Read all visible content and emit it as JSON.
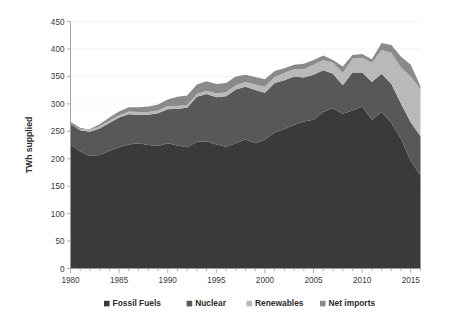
{
  "chart_data": {
    "type": "area",
    "stacked": true,
    "title": "",
    "subtitle": "",
    "xlabel": "",
    "ylabel": "TWh supplied",
    "xlim": [
      1980,
      2016
    ],
    "ylim": [
      0,
      450
    ],
    "ytick_step": 50,
    "yticks": [
      0,
      50,
      100,
      150,
      200,
      250,
      300,
      350,
      400,
      450
    ],
    "xticks": [
      1980,
      1985,
      1990,
      1995,
      2000,
      2005,
      2010,
      2015
    ],
    "grid": "horizontal-faint",
    "legend_position": "bottom",
    "x": [
      1980,
      1981,
      1982,
      1983,
      1984,
      1985,
      1986,
      1987,
      1988,
      1989,
      1990,
      1991,
      1992,
      1993,
      1994,
      1995,
      1996,
      1997,
      1998,
      1999,
      2000,
      2001,
      2002,
      2003,
      2004,
      2005,
      2006,
      2007,
      2008,
      2009,
      2010,
      2011,
      2012,
      2013,
      2014,
      2015,
      2016
    ],
    "series": [
      {
        "name": "Fossil Fuels",
        "color": "#3a3a3a",
        "values": [
          226,
          213,
          205,
          207,
          214,
          221,
          226,
          228,
          225,
          223,
          228,
          224,
          221,
          231,
          232,
          226,
          222,
          228,
          235,
          228,
          235,
          248,
          254,
          262,
          268,
          271,
          285,
          292,
          282,
          288,
          295,
          271,
          285,
          265,
          236,
          196,
          170
        ]
      },
      {
        "name": "Nuclear",
        "color": "#585858",
        "values": [
          37,
          39,
          44,
          48,
          51,
          54,
          55,
          52,
          55,
          60,
          62,
          67,
          72,
          82,
          86,
          86,
          92,
          98,
          96,
          97,
          85,
          90,
          89,
          88,
          80,
          82,
          76,
          63,
          52,
          69,
          62,
          69,
          70,
          71,
          64,
          70,
          71
        ]
      },
      {
        "name": "Renewables",
        "color": "#b9b9b9",
        "values": [
          4,
          4,
          4,
          4,
          4,
          4,
          5,
          5,
          5,
          5,
          6,
          5,
          5,
          5,
          6,
          7,
          7,
          8,
          9,
          10,
          11,
          11,
          13,
          13,
          15,
          18,
          19,
          20,
          22,
          25,
          27,
          35,
          43,
          57,
          66,
          84,
          86
        ]
      },
      {
        "name": "Net imports",
        "color": "#8a8a8a",
        "values": [
          -6,
          -2,
          1,
          4,
          6,
          7,
          8,
          9,
          10,
          11,
          12,
          17,
          17,
          17,
          17,
          17,
          17,
          16,
          13,
          14,
          14,
          11,
          9,
          8,
          10,
          9,
          8,
          5,
          12,
          7,
          7,
          6,
          13,
          14,
          20,
          21,
          5
        ]
      }
    ],
    "legend": [
      {
        "label": "Fossil Fuels",
        "color": "#3a3a3a"
      },
      {
        "label": "Nuclear",
        "color": "#585858"
      },
      {
        "label": "Renewables",
        "color": "#b9b9b9"
      },
      {
        "label": "Net imports",
        "color": "#8a8a8a"
      }
    ]
  }
}
